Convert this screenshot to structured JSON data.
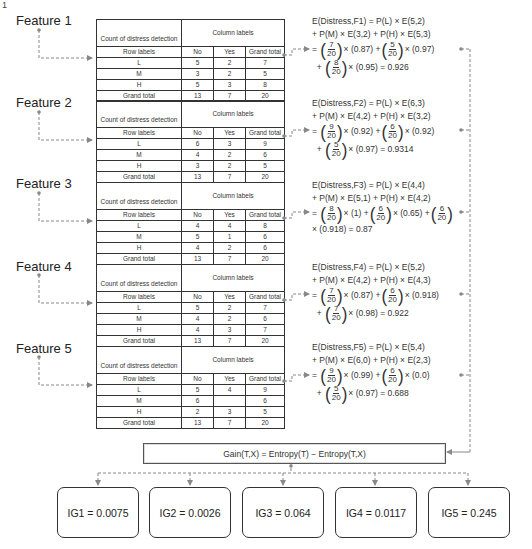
{
  "page_number": "1",
  "table_header": {
    "count_label": "Count of distress detection",
    "column_labels": "Column labels",
    "row_labels": "Row labels",
    "no": "No",
    "yes": "Yes",
    "grand_total": "Grand total"
  },
  "features": [
    {
      "label": "Feature 1",
      "rows": [
        {
          "label": "L",
          "no": "5",
          "yes": "2",
          "total": "7"
        },
        {
          "label": "M",
          "no": "3",
          "yes": "2",
          "total": "5"
        },
        {
          "label": "H",
          "no": "5",
          "yes": "3",
          "total": "8"
        },
        {
          "label": "Grand total",
          "no": "13",
          "yes": "7",
          "total": "20"
        }
      ],
      "formula": {
        "line1_lhs": "E(Distress,F1) = P(L) × E(5,2)",
        "line2": "+ P(M) × E(3,2) + P(H) × E(5,3)",
        "terms": [
          {
            "num": "7",
            "den": "20",
            "val": "× (0.87) +"
          },
          {
            "num": "5",
            "den": "20",
            "val": "× (0.97)"
          }
        ],
        "last_term": {
          "num": "8",
          "den": "20",
          "val": "× (0.95) = 0.926"
        }
      }
    },
    {
      "label": "Feature 2",
      "rows": [
        {
          "label": "L",
          "no": "6",
          "yes": "3",
          "total": "9"
        },
        {
          "label": "M",
          "no": "4",
          "yes": "2",
          "total": "6"
        },
        {
          "label": "H",
          "no": "3",
          "yes": "2",
          "total": "5"
        },
        {
          "label": "Grand total",
          "no": "13",
          "yes": "7",
          "total": "20"
        }
      ],
      "formula": {
        "line1_lhs": "E(Distress,F2) = P(L) × E(6,3)",
        "line2": "+ P(M) × E(4,2) + P(H) × E(3,2)",
        "terms": [
          {
            "num": "9",
            "den": "20",
            "val": "× (0.92) +"
          },
          {
            "num": "6",
            "den": "20",
            "val": "× (0.92)"
          }
        ],
        "last_term": {
          "num": "5",
          "den": "20",
          "val": "× (0.97) = 0.9314"
        }
      }
    },
    {
      "label": "Feature 3",
      "rows": [
        {
          "label": "L",
          "no": "4",
          "yes": "4",
          "total": "8"
        },
        {
          "label": "M",
          "no": "5",
          "yes": "1",
          "total": "6"
        },
        {
          "label": "H",
          "no": "4",
          "yes": "2",
          "total": "6"
        },
        {
          "label": "Grand total",
          "no": "13",
          "yes": "7",
          "total": "20"
        }
      ],
      "formula": {
        "line1_lhs": "E(Distress,F3) = P(L) × E(4,4)",
        "line2": "+ P(M) × E(5,1) + P(H) × E(4,2)",
        "terms": [
          {
            "num": "8",
            "den": "20",
            "val": "× (1) +"
          },
          {
            "num": "6",
            "den": "20",
            "val": "× (0.65) +"
          },
          {
            "num": "6",
            "den": "20",
            "val": ""
          }
        ],
        "tail": "× (0.918) = 0.87"
      }
    },
    {
      "label": "Feature 4",
      "rows": [
        {
          "label": "L",
          "no": "5",
          "yes": "2",
          "total": "7"
        },
        {
          "label": "M",
          "no": "4",
          "yes": "2",
          "total": "6"
        },
        {
          "label": "H",
          "no": "4",
          "yes": "3",
          "total": "7"
        },
        {
          "label": "Grand total",
          "no": "13",
          "yes": "7",
          "total": "20"
        }
      ],
      "formula": {
        "line1_lhs": "E(Distress,F4) = P(L) × E(5,2)",
        "line2": "+ P(M) × E(4,2) + P(H) × E(4,3)",
        "terms": [
          {
            "num": "7",
            "den": "20",
            "val": "× (0.87) +"
          },
          {
            "num": "6",
            "den": "20",
            "val": "× (0.918)"
          }
        ],
        "last_term": {
          "num": "7",
          "den": "20",
          "val": "× (0.98) = 0.922"
        }
      }
    },
    {
      "label": "Feature 5",
      "rows": [
        {
          "label": "L",
          "no": "5",
          "yes": "4",
          "total": "9"
        },
        {
          "label": "M",
          "no": "6",
          "yes": "",
          "total": "6"
        },
        {
          "label": "H",
          "no": "2",
          "yes": "3",
          "total": "5"
        },
        {
          "label": "Grand total",
          "no": "13",
          "yes": "7",
          "total": "20"
        }
      ],
      "formula": {
        "line1_lhs": "E(Distress,F5) = P(L) × E(5,4)",
        "line2": "+ P(M) × E(6,0) + P(H) × E(2,3)",
        "terms": [
          {
            "num": "9",
            "den": "20",
            "val": "× (0.99) +"
          },
          {
            "num": "6",
            "den": "20",
            "val": "× (0.0)"
          }
        ],
        "last_term": {
          "num": "5",
          "den": "20",
          "val": "× (0.97) = 0.688"
        }
      }
    }
  ],
  "gain_formula": "Gain(T,X) = Entropy(T) − Entropy(T,X)",
  "information_gains": [
    {
      "label": "IG1 = 0.0075"
    },
    {
      "label": "IG2 = 0.0026"
    },
    {
      "label": "IG3 = 0.064"
    },
    {
      "label": "IG4 = 0.0117"
    },
    {
      "label": "IG5 = 0.245"
    }
  ],
  "colors": {
    "line": "#888888",
    "text": "#222222",
    "border": "#333333"
  }
}
